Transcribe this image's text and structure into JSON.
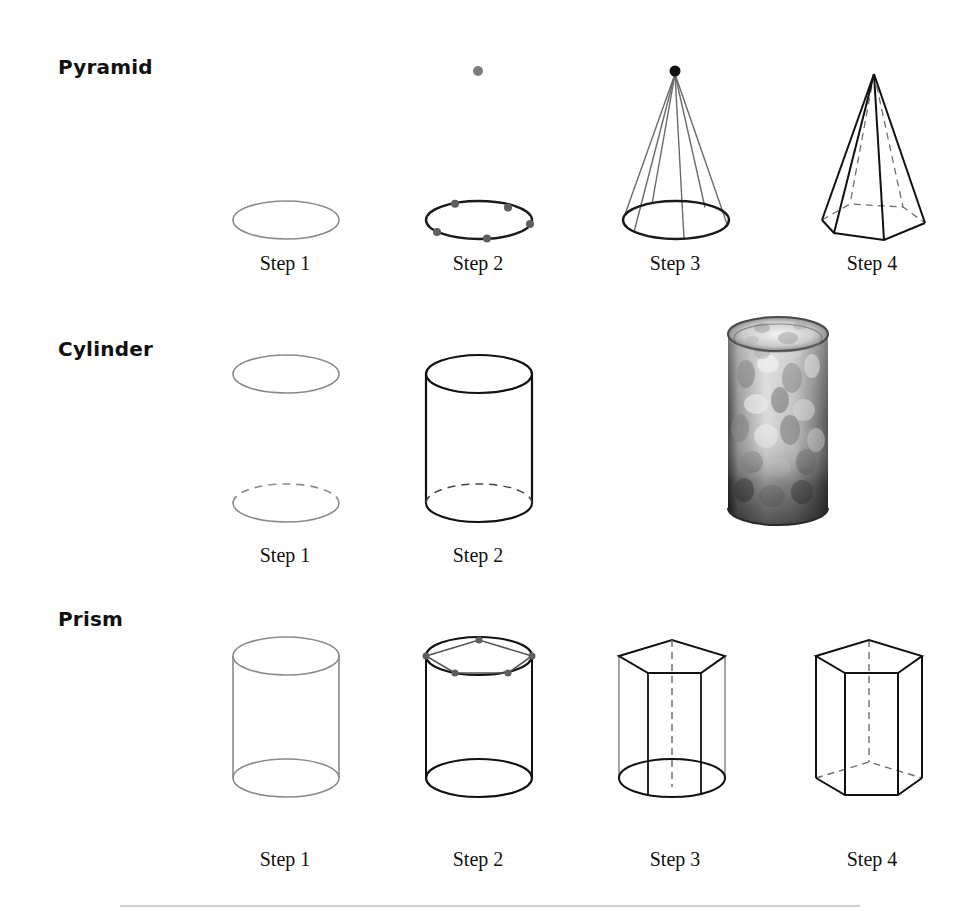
{
  "page": {
    "background_color": "#ffffff",
    "width": 972,
    "height": 911
  },
  "palette": {
    "guide_gray": "#8a8a8a",
    "ink_black": "#1a1a1a",
    "dot_gray": "#6f6f6f",
    "dash_gray": "#8a8a8a",
    "label_black": "#111111",
    "rule_gray": "#cfcfcf"
  },
  "rows": [
    {
      "id": "pyramid",
      "label": "Pyramid",
      "label_x": 58,
      "label_y": 55,
      "caption_y": 252,
      "steps": [
        {
          "caption": "Step 1",
          "caption_x": 285,
          "description": "Light gray ellipse forming the base guide circle in perspective",
          "kind": "ellipse-guide"
        },
        {
          "caption": "Step 2",
          "caption_x": 478,
          "description": "Darkened base ellipse with five marked vertex dots plus a single apex dot placed above",
          "kind": "ellipse-with-vertices",
          "vertex_count": 5,
          "apex_dot": true
        },
        {
          "caption": "Step 3",
          "caption_x": 675,
          "description": "Gray construction lines drawn from the apex dot down to each base vertex",
          "kind": "apex-rays",
          "vertex_count": 5
        },
        {
          "caption": "Step 4",
          "caption_x": 872,
          "description": "Finished pentagonal pyramid with solid visible edges and dashed hidden edges",
          "kind": "finished-pyramid",
          "vertex_count": 5
        }
      ]
    },
    {
      "id": "cylinder",
      "label": "Cylinder",
      "label_x": 58,
      "label_y": 337,
      "caption_y": 544,
      "steps": [
        {
          "caption": "Step 1",
          "caption_x": 285,
          "description": "Two light gray ellipses stacked vertically; the lower ellipse has a dashed far half",
          "kind": "two-ellipses"
        },
        {
          "caption": "Step 2",
          "caption_x": 478,
          "description": "Completed cylinder: ellipses joined by vertical sides, hidden back arc dashed",
          "kind": "finished-cylinder"
        }
      ],
      "photo": {
        "name": "mottled-glass-tumbler-photo",
        "description": "Black and white photograph of a speckled glass tumbler used as a real-world cylinder reference",
        "x": 722,
        "y": 312,
        "width": 112,
        "height": 222
      }
    },
    {
      "id": "prism",
      "label": "Prism",
      "label_x": 58,
      "label_y": 607,
      "caption_y": 848,
      "steps": [
        {
          "caption": "Step 1",
          "caption_x": 285,
          "description": "Light gray cylinder drawn as the construction guide for the prism",
          "kind": "cylinder-guide"
        },
        {
          "caption": "Step 2",
          "caption_x": 478,
          "description": "Five dots marked on the top ellipse and joined to form the pentagonal top face",
          "kind": "cylinder-with-pentagon-top",
          "vertex_count": 5
        },
        {
          "caption": "Step 3",
          "caption_x": 675,
          "description": "Vertical edges dropped from each pentagon vertex, hidden rear edge dashed",
          "kind": "prism-verticals",
          "vertex_count": 5
        },
        {
          "caption": "Step 4",
          "caption_x": 872,
          "description": "Finished pentagonal prism with dashed hidden bottom edges and guide circles removed",
          "kind": "finished-prism",
          "vertex_count": 5
        }
      ]
    }
  ]
}
